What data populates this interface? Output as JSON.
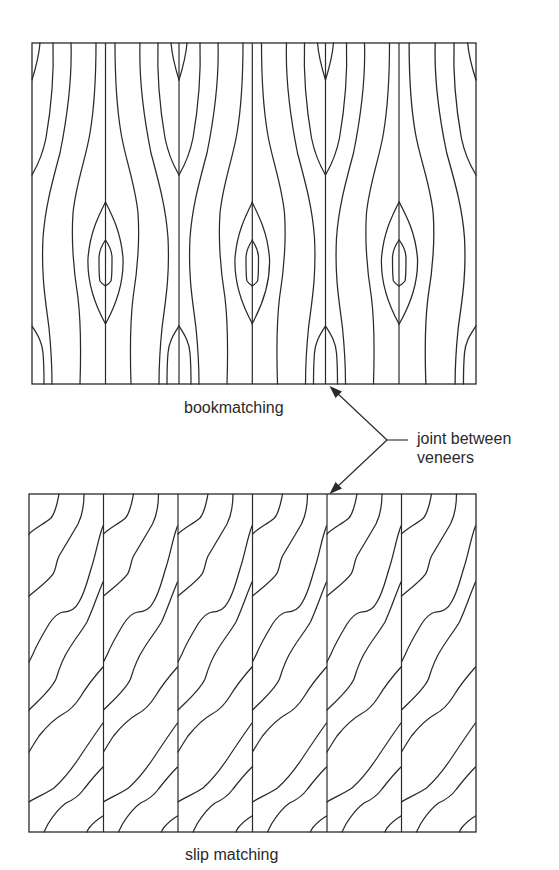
{
  "figure": {
    "panels": [
      {
        "id": "bookmatching",
        "caption": "bookmatching",
        "veneer_count": 6,
        "pattern": "mirrored (alternate veneers flipped like book pages)"
      },
      {
        "id": "slip-matching",
        "caption": "slip matching",
        "veneer_count": 6,
        "pattern": "repeated (veneers slid side by side without flipping)"
      }
    ],
    "callout": {
      "line1": "joint between",
      "line2": "veneers"
    },
    "colors": {
      "ink": "#2a2a2a",
      "background": "#ffffff"
    }
  }
}
